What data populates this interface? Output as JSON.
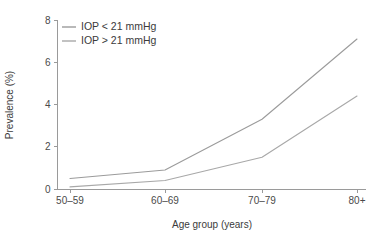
{
  "chart_data": {
    "type": "line",
    "title": "",
    "subtitle": "",
    "xlabel": "Age group (years)",
    "ylabel": "Prevalence (%)",
    "categories": [
      "50–59",
      "60–69",
      "70–79",
      "80+"
    ],
    "ylim": [
      0,
      8
    ],
    "yticks": [
      0,
      2,
      4,
      6,
      8
    ],
    "ytick_labels": [
      "0",
      "2",
      "4",
      "6",
      "8"
    ],
    "grid": false,
    "legend_position": "top-left-inside",
    "series": [
      {
        "name": "IOP < 21 mmHg",
        "values": [
          0.5,
          0.9,
          3.3,
          7.1
        ],
        "color": "#9b9b9b"
      },
      {
        "name": "IOP > 21 mmHg",
        "values": [
          0.1,
          0.4,
          1.5,
          4.4
        ],
        "color": "#a8a8a8"
      }
    ],
    "axis_color": "#9a9a9a",
    "text_color": "#3b3b3b"
  },
  "legend": {
    "items": [
      {
        "label": "IOP < 21 mmHg"
      },
      {
        "label": "IOP > 21 mmHg"
      }
    ]
  },
  "axes": {
    "y": {
      "title": "Prevalence (%)",
      "ticks": [
        "0",
        "2",
        "4",
        "6",
        "8"
      ]
    },
    "x": {
      "title": "Age group (years)",
      "ticks": [
        "50–59",
        "60–69",
        "70–79",
        "80+"
      ]
    }
  }
}
